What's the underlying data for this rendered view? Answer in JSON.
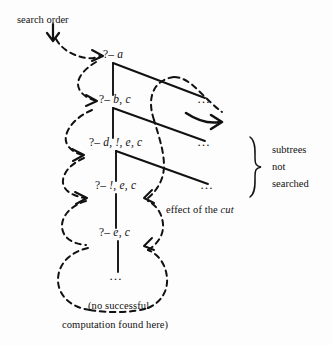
{
  "figure": {
    "background_color": "#fdfdfd",
    "ink_color": "#111111",
    "title_note": "Prolog SLD search tree showing the effect of the cut"
  },
  "annotations": {
    "search_order": "search order",
    "effect_of_cut_prefix": "effect of the ",
    "effect_of_cut_italic": "cut",
    "subtrees_line1": "subtrees",
    "subtrees_line2": "not",
    "subtrees_line3": "searched",
    "caption_line1": "(no successful",
    "caption_line2": "computation found here)"
  },
  "nodes": [
    {
      "id": "n1",
      "prefix": "?– ",
      "goal": "a"
    },
    {
      "id": "n2",
      "prefix": "?– ",
      "goal": "b, c"
    },
    {
      "id": "n3",
      "prefix": "?– ",
      "goal": "d, !, e, c"
    },
    {
      "id": "n4",
      "prefix": "?– ",
      "goal": "!, e, c"
    },
    {
      "id": "n5",
      "prefix": "?– ",
      "goal": "e, c"
    },
    {
      "id": "n6",
      "prefix": "",
      "goal": "…"
    }
  ],
  "branch_ellipses": [
    {
      "id": "e1",
      "text": "…"
    },
    {
      "id": "e2",
      "text": "…"
    },
    {
      "id": "e3",
      "text": "…"
    }
  ]
}
